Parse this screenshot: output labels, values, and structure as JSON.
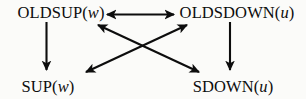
{
  "diagram": {
    "background_color": "#fbfbf9",
    "stroke_color": "#0d0d0d",
    "nodes": [
      {
        "id": "oldsup",
        "name": "OLDSUP",
        "prefix": "OLDSUP(",
        "variable": "w",
        "suffix": ")",
        "position": "top-left"
      },
      {
        "id": "oldsdown",
        "name": "OLDSDOWN",
        "prefix": "OLDSDOWN(",
        "variable": "u",
        "suffix": ")",
        "position": "top-right"
      },
      {
        "id": "sup",
        "name": "SUP",
        "prefix": "SUP(",
        "variable": "w",
        "suffix": ")",
        "position": "bottom-left"
      },
      {
        "id": "sdown",
        "name": "SDOWN",
        "prefix": "SDOWN(",
        "variable": "u",
        "suffix": ")",
        "position": "bottom-right"
      }
    ],
    "edges": [
      {
        "id": "oldsup-oldsdown",
        "from": "oldsup",
        "to": "oldsdown",
        "direction": "bidirectional",
        "orientation": "horizontal"
      },
      {
        "id": "oldsup-sup",
        "from": "oldsup",
        "to": "sup",
        "direction": "forward",
        "orientation": "vertical"
      },
      {
        "id": "oldsdown-sdown",
        "from": "oldsdown",
        "to": "sdown",
        "direction": "forward",
        "orientation": "vertical"
      },
      {
        "id": "oldsup-sdown",
        "from": "oldsup",
        "to": "sdown",
        "direction": "bidirectional",
        "orientation": "diagonal-down-right"
      },
      {
        "id": "oldsdown-sup",
        "from": "oldsdown",
        "to": "sup",
        "direction": "bidirectional",
        "orientation": "diagonal-down-left"
      }
    ]
  }
}
